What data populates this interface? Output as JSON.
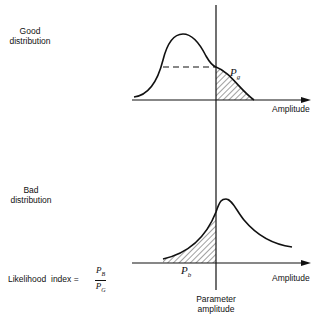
{
  "top_panel": {
    "label_line1": "Good",
    "label_line2": "distribution",
    "area_label": "P",
    "area_label_sub": "g",
    "axis_label": "Amplitude"
  },
  "bottom_panel": {
    "label_line1": "Bad",
    "label_line2": "distribution",
    "area_label": "P",
    "area_label_sub": "b",
    "axis_label": "Amplitude"
  },
  "formula": {
    "text": "Likelihood  index =",
    "numerator": "P",
    "numerator_sub": "B",
    "denominator": "P",
    "denominator_sub": "G"
  },
  "threshold_label_line1": "Parameter",
  "threshold_label_line2": "amplitude",
  "colors": {
    "ink": "#111111",
    "background": "#ffffff"
  }
}
